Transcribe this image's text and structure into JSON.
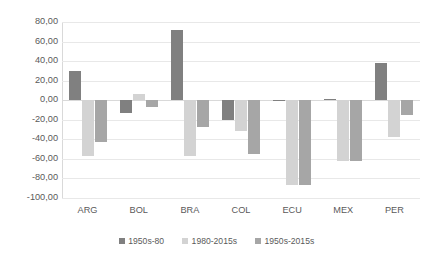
{
  "chart_data": {
    "type": "bar",
    "title": "",
    "subtitle": "",
    "xlabel": "",
    "ylabel": "",
    "categories": [
      "ARG",
      "BOL",
      "BRA",
      "COL",
      "ECU",
      "MEX",
      "PER"
    ],
    "series": [
      {
        "name": "1950s-80",
        "color": "#808080",
        "values": [
          30.0,
          -13.0,
          72.0,
          -20.0,
          -1.0,
          1.0,
          38.0
        ]
      },
      {
        "name": "1980-2015s",
        "color": "#d3d3d3",
        "values": [
          -57.0,
          6.0,
          -57.0,
          -31.0,
          -87.0,
          -62.0,
          -38.0
        ]
      },
      {
        "name": "1950s-2015s",
        "color": "#a6a6a6",
        "values": [
          -43.0,
          -7.0,
          -27.0,
          -55.0,
          -87.0,
          -62.0,
          -15.0
        ]
      }
    ],
    "ylim": [
      -100.0,
      80.0
    ],
    "ytick_step": 20.0,
    "ytick_labels": [
      "80,00",
      "60,00",
      "40,00",
      "20,00",
      "0,00",
      "-20,00",
      "-40,00",
      "-60,00",
      "-80,00",
      "-100,00"
    ],
    "ytick_values": [
      80,
      60,
      40,
      20,
      0,
      -20,
      -40,
      -60,
      -80,
      -100
    ],
    "grid": true,
    "legend_position": "bottom",
    "decimal_separator": ","
  },
  "legend": {
    "items": [
      {
        "label": "1950s-80",
        "color": "#808080"
      },
      {
        "label": "1980-2015s",
        "color": "#d3d3d3"
      },
      {
        "label": "1950s-2015s",
        "color": "#a6a6a6"
      }
    ]
  }
}
